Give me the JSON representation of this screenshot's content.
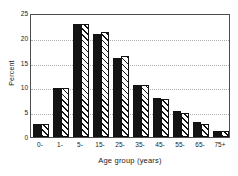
{
  "chart_data": {
    "type": "bar",
    "title": "",
    "xlabel": "Age group (years)",
    "ylabel": "Percent",
    "categories": [
      "0-",
      "1-",
      "5-",
      "15-",
      "25-",
      "35-",
      "45-",
      "55-",
      "65-",
      "75+"
    ],
    "series": [
      {
        "name": "series-solid",
        "fill": "solid-black",
        "values": [
          2.7,
          9.9,
          22.8,
          20.7,
          16.0,
          10.4,
          7.9,
          5.3,
          3.0,
          1.3
        ]
      },
      {
        "name": "series-hatched",
        "fill": "diagonal-hatch",
        "values": [
          2.7,
          9.9,
          22.8,
          21.2,
          16.3,
          10.4,
          7.7,
          4.9,
          2.7,
          1.3
        ]
      }
    ],
    "ylim": [
      0,
      25
    ],
    "yticks": [
      0,
      5,
      10,
      15,
      20,
      25
    ],
    "ytick_labels": [
      "0",
      "5",
      "10",
      "15",
      "20",
      "25"
    ],
    "grid": "horizontal-dotted",
    "legend": "none",
    "colors": {
      "bar_solid": "#141414",
      "bar_hatch_line": "#141414",
      "bar_hatch_bg": "#ffffff",
      "bar_edge": "#111111",
      "grid": "#b0b0b0",
      "axis": "#4d4d4d",
      "text": "#1a1a1a",
      "background": "#ffffff"
    }
  }
}
